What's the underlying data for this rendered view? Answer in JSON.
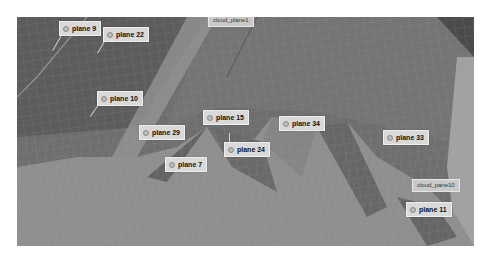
{
  "view": {
    "background": "#ffffff",
    "viewport_color": "#6e6e6e"
  },
  "plane_labels": [
    {
      "id": "plane9",
      "text": "plane 9",
      "x": 42,
      "y": 4
    },
    {
      "id": "plane22",
      "text": "plane 22",
      "x": 86,
      "y": 10
    },
    {
      "id": "plane10",
      "text": "plane 10",
      "x": 80,
      "y": 74
    },
    {
      "id": "plane29",
      "text": "plane 29",
      "x": 122,
      "y": 108
    },
    {
      "id": "plane15",
      "text": "plane 15",
      "x": 186,
      "y": 93
    },
    {
      "id": "plane34",
      "text": "plane 34",
      "x": 262,
      "y": 99
    },
    {
      "id": "plane7",
      "text": "plane 7",
      "x": 148,
      "y": 140
    },
    {
      "id": "plane24",
      "text": "plane 24",
      "x": 207,
      "y": 125
    },
    {
      "id": "plane33",
      "text": "plane 33",
      "x": 366,
      "y": 113
    },
    {
      "id": "plane11",
      "text": "plane 11",
      "x": 389,
      "y": 185
    }
  ],
  "cloud_labels": [
    {
      "id": "cloud_plane1",
      "text": "cloud_plane1",
      "x": 191,
      "y": -3
    },
    {
      "id": "cloud_plane10",
      "text": "cloud_pane10",
      "x": 395,
      "y": 162
    }
  ]
}
